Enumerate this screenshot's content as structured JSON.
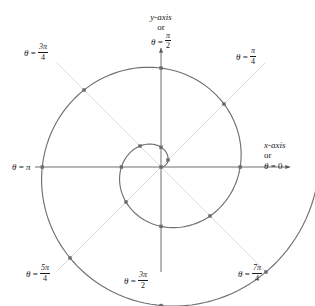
{
  "figure": {
    "width": 315,
    "height": 306,
    "background": "#ffffff"
  },
  "colors": {
    "axis": "#6e6e6e",
    "ray": "#d8d8d8",
    "curve": "#707070",
    "marker": "#6a6a73",
    "text": "#1a1a1a"
  },
  "axes": {
    "x_axis": {
      "line1": "x-axis",
      "line2": "or",
      "theta_symbol": "θ",
      "equals": "=",
      "value": "0",
      "full": "x-axis or θ = 0"
    },
    "y_axis": {
      "line1": "y-axis",
      "line2": "or",
      "theta_symbol": "θ",
      "equals": "=",
      "numerator": "π",
      "denominator": "2",
      "full": "y-axis or θ = π/2"
    }
  },
  "ray_labels": [
    {
      "id": "theta-pi-over-4",
      "theta_symbol": "θ",
      "equals": "=",
      "numerator": "π",
      "denominator": "4",
      "full": "θ = π/4",
      "angle_deg": 45
    },
    {
      "id": "theta-3pi-over-4",
      "theta_symbol": "θ",
      "equals": "=",
      "numerator": "3π",
      "denominator": "4",
      "full": "θ = 3π/4",
      "angle_deg": 135
    },
    {
      "id": "theta-pi",
      "theta_symbol": "θ",
      "equals": "=",
      "value": "π",
      "full": "θ = π",
      "angle_deg": 180
    },
    {
      "id": "theta-5pi-over-4",
      "theta_symbol": "θ",
      "equals": "=",
      "numerator": "5π",
      "denominator": "4",
      "full": "θ = 5π/4",
      "angle_deg": 225
    },
    {
      "id": "theta-3pi-over-2",
      "theta_symbol": "θ",
      "equals": "=",
      "numerator": "3π",
      "denominator": "2",
      "full": "θ = 3π/2",
      "angle_deg": 270
    },
    {
      "id": "theta-7pi-over-4",
      "theta_symbol": "θ",
      "equals": "=",
      "numerator": "7π",
      "denominator": "4",
      "full": "θ = 7π/4",
      "angle_deg": 315
    }
  ],
  "chart_data": {
    "type": "line",
    "subtype": "polar-spiral",
    "title": "",
    "xlabel": "x-axis or θ = 0",
    "ylabel": "y-axis or θ = π/2",
    "grid": "polar-rays",
    "legend": "none",
    "equation": "r = θ",
    "origin_px": [
      161,
      167
    ],
    "scale_px_per_unit": 12.6,
    "theta_range_rad": [
      0,
      12.566
    ],
    "theta_step_rad": 0.7854,
    "xlim_px": [
      15,
      300
    ],
    "ylim_px": [
      20,
      290
    ],
    "rays": [
      {
        "theta_deg": 0,
        "theta_label": "θ = 0"
      },
      {
        "theta_deg": 45,
        "theta_label": "θ = π/4"
      },
      {
        "theta_deg": 90,
        "theta_label": "θ = π/2"
      },
      {
        "theta_deg": 135,
        "theta_label": "θ = 3π/4"
      },
      {
        "theta_deg": 180,
        "theta_label": "θ = π"
      },
      {
        "theta_deg": 225,
        "theta_label": "θ = 5π/4"
      },
      {
        "theta_deg": 270,
        "theta_label": "θ = 3π/2"
      },
      {
        "theta_deg": 315,
        "theta_label": "θ = 7π/4"
      }
    ],
    "marked_points": [
      {
        "theta_rad": 0.0,
        "theta_label": "0",
        "r": 0.0
      },
      {
        "theta_rad": 0.785,
        "theta_label": "π/4",
        "r": 0.785
      },
      {
        "theta_rad": 1.571,
        "theta_label": "π/2",
        "r": 1.571
      },
      {
        "theta_rad": 2.356,
        "theta_label": "3π/4",
        "r": 2.356
      },
      {
        "theta_rad": 3.142,
        "theta_label": "π",
        "r": 3.142
      },
      {
        "theta_rad": 3.927,
        "theta_label": "5π/4",
        "r": 3.927
      },
      {
        "theta_rad": 4.712,
        "theta_label": "3π/2",
        "r": 4.712
      },
      {
        "theta_rad": 5.498,
        "theta_label": "7π/4",
        "r": 5.498
      },
      {
        "theta_rad": 6.283,
        "theta_label": "2π",
        "r": 6.283
      },
      {
        "theta_rad": 7.069,
        "theta_label": "9π/4",
        "r": 7.069
      },
      {
        "theta_rad": 7.854,
        "theta_label": "5π/2",
        "r": 7.854
      },
      {
        "theta_rad": 8.639,
        "theta_label": "11π/4",
        "r": 8.639
      },
      {
        "theta_rad": 9.425,
        "theta_label": "3π",
        "r": 9.425
      },
      {
        "theta_rad": 10.21,
        "theta_label": "13π/4",
        "r": 10.21
      },
      {
        "theta_rad": 10.996,
        "theta_label": "7π/2",
        "r": 10.996
      },
      {
        "theta_rad": 11.781,
        "theta_label": "15π/4",
        "r": 11.781
      },
      {
        "theta_rad": 12.566,
        "theta_label": "4π",
        "r": 12.566
      }
    ]
  }
}
